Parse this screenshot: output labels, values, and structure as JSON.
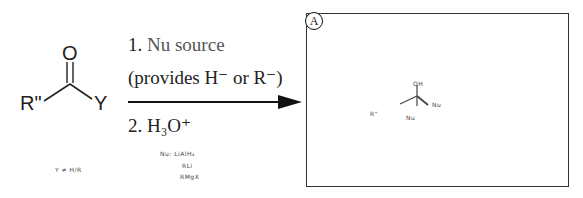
{
  "reactant": {
    "atom_o": "O",
    "group_left": "R\"",
    "group_right": "Y",
    "note": "Y ≠ H/R"
  },
  "arrow": {
    "step1_num": "1.",
    "step1_text": "Nu source",
    "step1_sub": "(provides H⁻ or R⁻)",
    "step2_num": "2.",
    "step2_text": "H₃O⁺"
  },
  "nu_notes": [
    "Nu: LiAlH₄",
    "RLi",
    "RMgX"
  ],
  "product_box": {
    "label": "A",
    "oh": "OH",
    "r_group": "R\"",
    "nu_right": "Nu",
    "nu_bottom": "Nu"
  },
  "colors": {
    "ink": "#222222",
    "nu_text": "#555555",
    "box_border": "#333333"
  }
}
